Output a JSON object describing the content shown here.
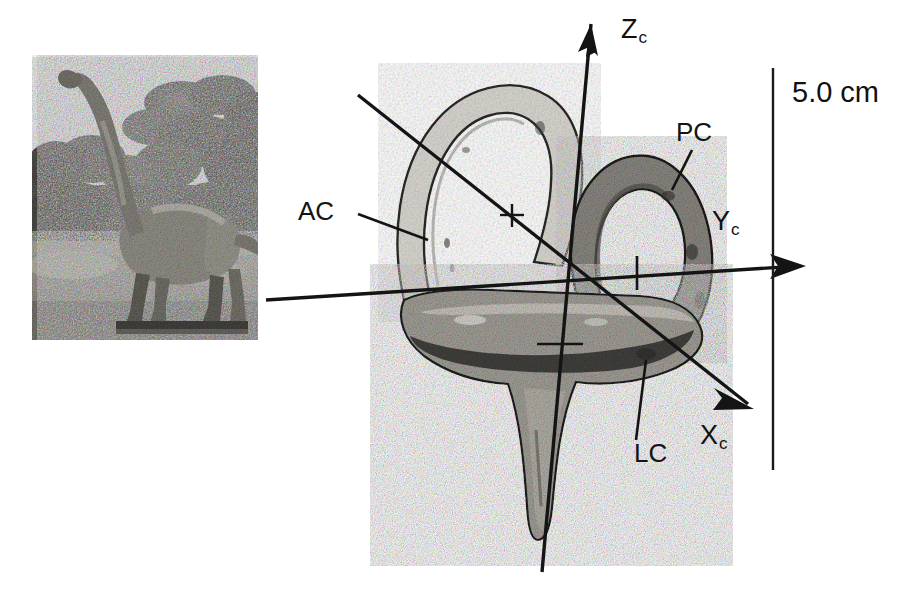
{
  "figure": {
    "kind": "scientific-figure",
    "background_color": "#ffffff",
    "width": 915,
    "height": 592
  },
  "photo": {
    "name": "sauropod-dinosaur-photo",
    "subject": "Brachiosaurus model standing in vegetation",
    "tone": "grayscale-halftone",
    "frame": {
      "x": 32,
      "y": 55,
      "w": 226,
      "h": 285
    }
  },
  "specimen": {
    "name": "bony-labyrinth",
    "parts": [
      {
        "id": "AC",
        "label": "AC",
        "meaning": "anterior semicircular canal"
      },
      {
        "id": "PC",
        "label": "PC",
        "meaning": "posterior semicircular canal"
      },
      {
        "id": "LC",
        "label": "LC",
        "meaning": "lateral semicircular canal"
      }
    ]
  },
  "labels": {
    "ac": "AC",
    "pc": "PC",
    "lc": "LC"
  },
  "axes": [
    {
      "id": "Zc",
      "base": "Z",
      "sub": "c",
      "label": "Zc",
      "direction": "up",
      "tip": [
        588,
        12
      ]
    },
    {
      "id": "Yc",
      "base": "Y",
      "sub": "c",
      "label": "Yc",
      "direction": "right",
      "tip": [
        808,
        268
      ]
    },
    {
      "id": "Xc",
      "base": "X",
      "sub": "c",
      "label": "Xc",
      "direction": "down-right",
      "tip": [
        760,
        415
      ]
    }
  ],
  "axis_label_text": {
    "z_base": "Z",
    "z_sub": "c",
    "y_base": "Y",
    "y_sub": "c",
    "x_base": "X",
    "x_sub": "c"
  },
  "scale_bar": {
    "name": "scale-bar",
    "text": "5.0 cm",
    "value": 5.0,
    "unit": "cm",
    "orientation": "vertical",
    "x": 773,
    "y_top": 68,
    "y_bottom": 470
  },
  "colors": {
    "ink": "#111111",
    "line": "#1a1a1a",
    "canal_light": "#d8d6d0",
    "canal_dark": "#8a8782",
    "vestibule": "#6e6b66",
    "background": "#ffffff"
  }
}
